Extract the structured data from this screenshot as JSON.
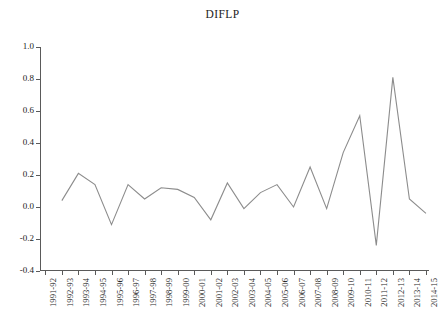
{
  "chart_data": {
    "type": "line",
    "title": "DIFLP",
    "xlabel": "",
    "ylabel": "",
    "ylim": [
      -0.4,
      1.0
    ],
    "yticks": [
      "1.0",
      "0.8",
      "0.6",
      "0.4",
      "0.2",
      "0.0",
      "-0.2",
      "-0.4"
    ],
    "ytick_values": [
      1.0,
      0.8,
      0.6,
      0.4,
      0.2,
      0.0,
      -0.2,
      -0.4
    ],
    "grid": false,
    "legend": "none",
    "line_color": "#8c8c8c",
    "axis_color": "#5a5a5a",
    "categories": [
      "1991-92",
      "1992-93",
      "1993-94",
      "1994-95",
      "1995-96",
      "1996-97",
      "1997-98",
      "1998-99",
      "1999-00",
      "2000-01",
      "2001-02",
      "2002-03",
      "2003-04",
      "2004-05",
      "2005-06",
      "2006-07",
      "2007-08",
      "2008-09",
      "2009-10",
      "2010-11",
      "2011-12",
      "2012-13",
      "2013-14",
      "2014-15"
    ],
    "series": [
      {
        "name": "DIFLP",
        "values": [
          null,
          0.04,
          0.21,
          0.14,
          -0.11,
          0.14,
          0.05,
          0.12,
          0.11,
          0.06,
          -0.08,
          0.15,
          -0.01,
          0.09,
          0.14,
          0.0,
          0.25,
          -0.01,
          0.34,
          0.57,
          -0.24,
          0.81,
          0.05,
          -0.04
        ]
      }
    ]
  }
}
